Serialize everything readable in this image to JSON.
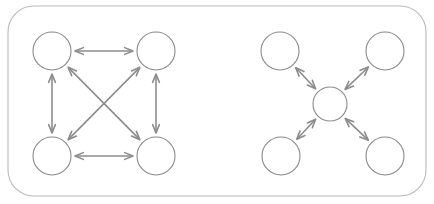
{
  "canvas": {
    "width": 434,
    "height": 204,
    "background_color": "#ffffff"
  },
  "panel": {
    "name": "rounded-panel",
    "x": 8,
    "y": 6,
    "width": 418,
    "height": 190,
    "corner_radius": 26,
    "stroke_color": "#b9b9b9",
    "stroke_width": 1.1,
    "fill_color": "#ffffff"
  },
  "style": {
    "node_stroke_color": "#8a8a8a",
    "node_stroke_width": 1.1,
    "node_fill_color": "#ffffff",
    "arrow_color": "#8c8c8c",
    "arrow_stroke_width": 1.6,
    "arrowhead_stroke_width": 1.6,
    "arrowhead_length": 9,
    "arrowhead_half_angle_deg": 22
  },
  "diagrams": [
    {
      "id": "mesh-topology",
      "label": "fully-connected-mesh",
      "topology_type": "mesh",
      "node_radius": 19,
      "nodes": [
        {
          "id": "mesh-node-top-left",
          "cx": 52,
          "cy": 51
        },
        {
          "id": "mesh-node-top-right",
          "cx": 156,
          "cy": 51
        },
        {
          "id": "mesh-node-bottom-left",
          "cx": 52,
          "cy": 156
        },
        {
          "id": "mesh-node-bottom-right",
          "cx": 156,
          "cy": 156
        }
      ],
      "links": [
        {
          "id": "mesh-link-top",
          "from": "mesh-node-top-left",
          "to": "mesh-node-top-right",
          "bidirectional": true
        },
        {
          "id": "mesh-link-bottom",
          "from": "mesh-node-bottom-left",
          "to": "mesh-node-bottom-right",
          "bidirectional": true
        },
        {
          "id": "mesh-link-left",
          "from": "mesh-node-top-left",
          "to": "mesh-node-bottom-left",
          "bidirectional": true
        },
        {
          "id": "mesh-link-right",
          "from": "mesh-node-top-right",
          "to": "mesh-node-bottom-right",
          "bidirectional": true
        },
        {
          "id": "mesh-link-diagonal-nw-se",
          "from": "mesh-node-top-left",
          "to": "mesh-node-bottom-right",
          "bidirectional": true
        },
        {
          "id": "mesh-link-diagonal-ne-sw",
          "from": "mesh-node-top-right",
          "to": "mesh-node-bottom-left",
          "bidirectional": true
        }
      ]
    },
    {
      "id": "star-topology",
      "label": "star-hub-and-spoke",
      "topology_type": "star",
      "node_radius": 19,
      "hub_radius": 17,
      "nodes": [
        {
          "id": "star-node-top-left",
          "cx": 280,
          "cy": 51,
          "radius": 19
        },
        {
          "id": "star-node-top-right",
          "cx": 385,
          "cy": 51,
          "radius": 19
        },
        {
          "id": "star-node-bottom-left",
          "cx": 281,
          "cy": 156,
          "radius": 19
        },
        {
          "id": "star-node-bottom-right",
          "cx": 385,
          "cy": 156,
          "radius": 19
        },
        {
          "id": "star-node-hub",
          "cx": 330,
          "cy": 104,
          "radius": 17
        }
      ],
      "links": [
        {
          "id": "star-link-hub-top-left",
          "from": "star-node-hub",
          "to": "star-node-top-left",
          "bidirectional": true
        },
        {
          "id": "star-link-hub-top-right",
          "from": "star-node-hub",
          "to": "star-node-top-right",
          "bidirectional": true
        },
        {
          "id": "star-link-hub-bottom-left",
          "from": "star-node-hub",
          "to": "star-node-bottom-left",
          "bidirectional": true
        },
        {
          "id": "star-link-hub-bottom-right",
          "from": "star-node-hub",
          "to": "star-node-bottom-right",
          "bidirectional": true
        }
      ]
    }
  ]
}
